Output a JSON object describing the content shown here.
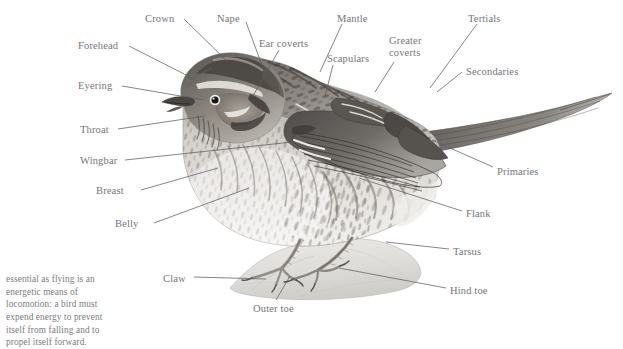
{
  "figure": {
    "type": "anatomical-diagram",
    "style": "grayscale pencil / stipple illustration on white background",
    "background_color": "#ffffff",
    "label_text_color": "#75757a",
    "leader_line_color": "#5d5d62"
  },
  "labels": [
    {
      "id": "crown",
      "text": "Crown",
      "x": 145,
      "y": 13,
      "anchor": "left"
    },
    {
      "id": "nape",
      "text": "Nape",
      "x": 217,
      "y": 13,
      "anchor": "left"
    },
    {
      "id": "mantle",
      "text": "Mantle",
      "x": 337,
      "y": 13,
      "anchor": "left"
    },
    {
      "id": "tertials",
      "text": "Tertials",
      "x": 468,
      "y": 13,
      "anchor": "left"
    },
    {
      "id": "forehead",
      "text": "Forehead",
      "x": 78,
      "y": 40,
      "anchor": "left"
    },
    {
      "id": "ear-coverts",
      "text": "Ear coverts",
      "x": 259,
      "y": 38,
      "anchor": "left"
    },
    {
      "id": "greater-coverts",
      "text": "Greater coverts",
      "x": 389,
      "y": 35,
      "anchor": "left",
      "lines": [
        "Greater",
        "coverts"
      ]
    },
    {
      "id": "secondaries",
      "text": "Secondaries",
      "x": 466,
      "y": 66,
      "anchor": "left"
    },
    {
      "id": "scapulars",
      "text": "Scapulars",
      "x": 327,
      "y": 53,
      "anchor": "left"
    },
    {
      "id": "eyering",
      "text": "Eyering",
      "x": 78,
      "y": 80,
      "anchor": "left"
    },
    {
      "id": "throat",
      "text": "Throat",
      "x": 80,
      "y": 124,
      "anchor": "left"
    },
    {
      "id": "wingbar",
      "text": "Wingbar",
      "x": 80,
      "y": 155,
      "anchor": "left"
    },
    {
      "id": "primaries",
      "text": "Primaries",
      "x": 497,
      "y": 166,
      "anchor": "left"
    },
    {
      "id": "breast",
      "text": "Breast",
      "x": 96,
      "y": 185,
      "anchor": "left"
    },
    {
      "id": "belly",
      "text": "Belly",
      "x": 115,
      "y": 218,
      "anchor": "left"
    },
    {
      "id": "flank",
      "text": "Flank",
      "x": 466,
      "y": 208,
      "anchor": "left"
    },
    {
      "id": "tarsus",
      "text": "Tarsus",
      "x": 453,
      "y": 246,
      "anchor": "left"
    },
    {
      "id": "claw",
      "text": "Claw",
      "x": 163,
      "y": 273,
      "anchor": "left"
    },
    {
      "id": "hind-toe",
      "text": "Hind toe",
      "x": 450,
      "y": 285,
      "anchor": "left"
    },
    {
      "id": "outer-toe",
      "text": "Outer toe",
      "x": 253,
      "y": 303,
      "anchor": "left"
    }
  ],
  "leader_lines": [
    {
      "id": "crown",
      "x1": 184,
      "y1": 19,
      "x2": 228,
      "y2": 62
    },
    {
      "id": "nape",
      "x1": 246,
      "y1": 22,
      "x2": 263,
      "y2": 68
    },
    {
      "id": "mantle",
      "x1": 342,
      "y1": 24,
      "x2": 320,
      "y2": 72
    },
    {
      "id": "tertials",
      "x1": 477,
      "y1": 24,
      "x2": 430,
      "y2": 88
    },
    {
      "id": "forehead",
      "x1": 129,
      "y1": 46,
      "x2": 196,
      "y2": 80
    },
    {
      "id": "ear-coverts",
      "x1": 279,
      "y1": 50,
      "x2": 253,
      "y2": 96
    },
    {
      "id": "greater-coverts",
      "x1": 394,
      "y1": 62,
      "x2": 375,
      "y2": 92
    },
    {
      "id": "secondaries",
      "x1": 462,
      "y1": 72,
      "x2": 437,
      "y2": 92
    },
    {
      "id": "scapulars",
      "x1": 333,
      "y1": 65,
      "x2": 325,
      "y2": 96
    },
    {
      "id": "eyering",
      "x1": 122,
      "y1": 86,
      "x2": 204,
      "y2": 100
    },
    {
      "id": "throat",
      "x1": 118,
      "y1": 129,
      "x2": 205,
      "y2": 116
    },
    {
      "id": "wingbar",
      "x1": 125,
      "y1": 160,
      "x2": 292,
      "y2": 142
    },
    {
      "id": "primaries",
      "x1": 493,
      "y1": 167,
      "x2": 432,
      "y2": 140
    },
    {
      "id": "breast",
      "x1": 141,
      "y1": 190,
      "x2": 218,
      "y2": 168
    },
    {
      "id": "belly",
      "x1": 154,
      "y1": 223,
      "x2": 249,
      "y2": 188
    },
    {
      "id": "flank",
      "x1": 462,
      "y1": 211,
      "x2": 359,
      "y2": 178
    },
    {
      "id": "tarsus",
      "x1": 449,
      "y1": 249,
      "x2": 386,
      "y2": 242
    },
    {
      "id": "claw",
      "x1": 194,
      "y1": 277,
      "x2": 266,
      "y2": 279
    },
    {
      "id": "hind-toe",
      "x1": 446,
      "y1": 288,
      "x2": 339,
      "y2": 268
    },
    {
      "id": "outer-toe",
      "x1": 276,
      "y1": 300,
      "x2": 290,
      "y2": 276
    }
  ],
  "caption": {
    "id": "caption-paragraph",
    "text": "essential as flying is an energetic means of locomotion: a bird must expend energy to prevent itself from falling and to propel itself forward."
  }
}
